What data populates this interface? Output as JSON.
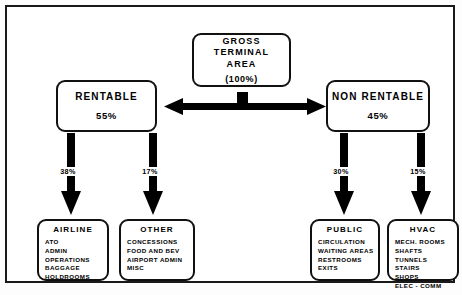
{
  "diagram": {
    "root": {
      "title_lines": "GROSS\nTERMINAL\nAREA",
      "percent": "(100%)"
    },
    "branches": [
      {
        "title": "RENTABLE",
        "percent": "55%"
      },
      {
        "title": "NON RENTABLE",
        "percent": "45%"
      }
    ],
    "connector_percents": {
      "airline": "38%",
      "other": "17%",
      "public": "30%",
      "hvac": "15%"
    },
    "leaves": [
      {
        "title": "AIRLINE",
        "items": [
          "ATO",
          "ADMIN",
          "OPERATIONS",
          "BAGGAGE",
          "HOLDROOMS"
        ]
      },
      {
        "title": "OTHER",
        "items": [
          "CONCESSIONS",
          "FOOD AND BEV",
          "AIRPORT ADMIN",
          "MISC"
        ]
      },
      {
        "title": "PUBLIC",
        "items": [
          "CIRCULATION",
          "WAITING AREAS",
          "RESTROOMS",
          "EXITS"
        ]
      },
      {
        "title": "HVAC",
        "items": [
          "MECH. ROOMS",
          "SHAFTS",
          "TUNNELS",
          "STAIRS",
          "SHOPS",
          "ELEC - COMM"
        ]
      }
    ],
    "colors": {
      "ink": "#000000",
      "border": "#111111",
      "background": "#ffffff"
    }
  }
}
